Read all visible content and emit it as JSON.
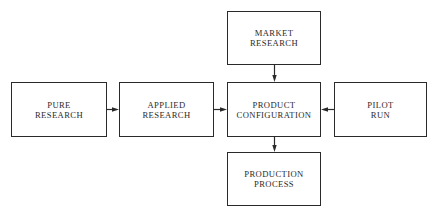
{
  "diagram": {
    "nodes": [
      {
        "id": "pure_research",
        "lines": [
          "PURE",
          "RESEARCH"
        ],
        "x": 11,
        "y": 82,
        "w": 96,
        "h": 55
      },
      {
        "id": "applied_research",
        "lines": [
          "APPLIED",
          "RESEARCH"
        ],
        "x": 119,
        "y": 82,
        "w": 95,
        "h": 55
      },
      {
        "id": "product_configuration",
        "lines": [
          "PRODUCT",
          "CONFIGURATION"
        ],
        "x": 227,
        "y": 82,
        "w": 94,
        "h": 55
      },
      {
        "id": "pilot_run",
        "lines": [
          "PILOT",
          "RUN"
        ],
        "x": 334,
        "y": 82,
        "w": 93,
        "h": 55
      },
      {
        "id": "market_research",
        "lines": [
          "MARKET",
          "RESEARCH"
        ],
        "x": 227,
        "y": 11,
        "w": 94,
        "h": 54
      },
      {
        "id": "production_process",
        "lines": [
          "PRODUCTION",
          "PROCESS"
        ],
        "x": 227,
        "y": 152,
        "w": 94,
        "h": 54
      }
    ],
    "edges": [
      {
        "from": "pure_research",
        "to": "applied_research"
      },
      {
        "from": "applied_research",
        "to": "product_configuration"
      },
      {
        "from": "pilot_run",
        "to": "product_configuration"
      },
      {
        "from": "market_research",
        "to": "product_configuration"
      },
      {
        "from": "product_configuration",
        "to": "production_process"
      }
    ]
  }
}
